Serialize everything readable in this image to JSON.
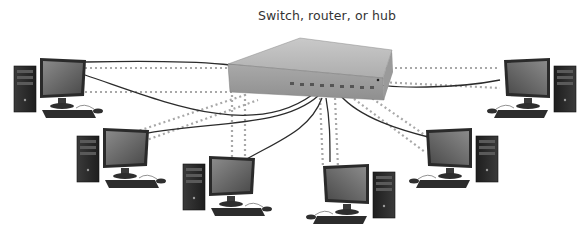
{
  "diagram": {
    "title": "Switch, router, or hub",
    "topology": "star",
    "center_node": {
      "label": "Switch, router, or hub",
      "icon": "network-switch-icon"
    },
    "nodes": [
      {
        "id": "pc-1",
        "icon": "desktop-computer-icon",
        "position": "top-left"
      },
      {
        "id": "pc-2",
        "icon": "desktop-computer-icon",
        "position": "middle-left"
      },
      {
        "id": "pc-3",
        "icon": "desktop-computer-icon",
        "position": "bottom-left"
      },
      {
        "id": "pc-4",
        "icon": "desktop-computer-icon",
        "position": "bottom-center"
      },
      {
        "id": "pc-5",
        "icon": "desktop-computer-icon",
        "position": "middle-right"
      },
      {
        "id": "pc-6",
        "icon": "desktop-computer-icon",
        "position": "top-right"
      }
    ],
    "link_styles": {
      "cable": "solid dark line",
      "signal_path": "dotted gray line"
    },
    "colors": {
      "cable": "#2b2b2b",
      "dotted": "#a8a8a8",
      "device": "#6d6d6d",
      "switch": "#b8b8b8"
    }
  }
}
